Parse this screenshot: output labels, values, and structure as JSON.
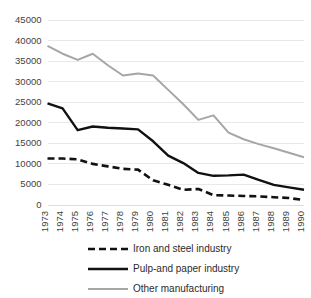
{
  "chart_data": {
    "type": "line",
    "title": "",
    "subtitle": "",
    "xlabel": "",
    "ylabel": "",
    "grid": true,
    "legend_position": "bottom",
    "xlim": [
      1973,
      1990
    ],
    "ylim": [
      0,
      45000
    ],
    "ytick_step": 5000,
    "categories": [
      "1973",
      "1974",
      "1975",
      "1976",
      "1977",
      "1978",
      "1979",
      "1980",
      "1981",
      "1982",
      "1983",
      "1984",
      "1985",
      "1986",
      "1987",
      "1988",
      "1989",
      "1990"
    ],
    "x": [
      1973,
      1974,
      1975,
      1976,
      1977,
      1978,
      1979,
      1980,
      1981,
      1982,
      1983,
      1984,
      1985,
      1986,
      1987,
      1988,
      1989,
      1990
    ],
    "ytick_labels": [
      "0",
      "5000",
      "10000",
      "15000",
      "20000",
      "25000",
      "30000",
      "35000",
      "40000",
      "45000"
    ],
    "ytick_values": [
      0,
      5000,
      10000,
      15000,
      20000,
      25000,
      30000,
      35000,
      40000,
      45000
    ],
    "series": [
      {
        "name": "Iron and steel industry",
        "color": "#111111",
        "style": "dashed",
        "width": 2.6,
        "values": [
          11300,
          11300,
          11100,
          10000,
          9400,
          8800,
          8600,
          6000,
          4900,
          3700,
          3900,
          2400,
          2300,
          2200,
          2100,
          1900,
          1700,
          1200
        ]
      },
      {
        "name": "Pulp-and paper industry",
        "color": "#111111",
        "style": "solid",
        "width": 2.4,
        "values": [
          24700,
          23500,
          18200,
          19100,
          18800,
          18600,
          18400,
          15500,
          12000,
          10200,
          7800,
          7100,
          7200,
          7400,
          6100,
          4900,
          4300,
          3700
        ]
      },
      {
        "name": "Other manufacturing",
        "color": "#a6a6a6",
        "style": "solid",
        "width": 2.0,
        "values": [
          38700,
          36800,
          35300,
          36800,
          34000,
          31500,
          32000,
          31500,
          28000,
          24500,
          20700,
          21800,
          17600,
          16000,
          14800,
          13800,
          12700,
          11600
        ]
      }
    ]
  },
  "legend": {
    "items": [
      {
        "label": "Iron and steel industry",
        "color": "#111111",
        "style": "dashed"
      },
      {
        "label": "Pulp-and paper industry",
        "color": "#111111",
        "style": "solid"
      },
      {
        "label": "Other manufacturing",
        "color": "#a6a6a6",
        "style": "solid"
      }
    ]
  }
}
